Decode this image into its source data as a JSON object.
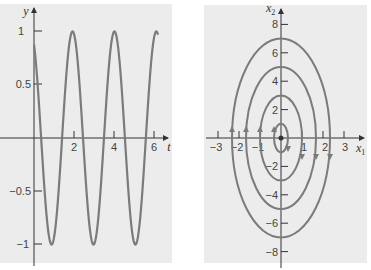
{
  "chart_data": [
    {
      "type": "line",
      "title": "",
      "xlabel": "t",
      "ylabel": "y",
      "xlim": [
        0,
        6.3
      ],
      "ylim": [
        -1.1,
        1.15
      ],
      "x_ticks": [
        2,
        4,
        6
      ],
      "x_tick_labels": [
        "2",
        "4",
        "6"
      ],
      "y_ticks": [
        1,
        0.5,
        -0.5,
        -1
      ],
      "y_tick_labels": [
        "1",
        "0.5",
        "−0.5",
        "−1"
      ],
      "grid": false,
      "series": [
        {
          "name": "y(t)",
          "description": "oscillation y ≈ cos(3t + 0.5), period ≈ 2.09",
          "x": [
            0,
            0.4,
            0.95,
            1.5,
            2.0,
            2.5,
            3.05,
            3.6,
            4.1,
            4.6,
            5.15,
            5.7,
            6.2
          ],
          "y": [
            0.88,
            0.0,
            -1.0,
            0.0,
            1.0,
            0.0,
            -1.0,
            0.0,
            1.0,
            0.0,
            -1.0,
            0.0,
            1.0
          ]
        }
      ],
      "color": "#7a7a7a",
      "background": "#ececec"
    },
    {
      "type": "line",
      "subtype": "phase-portrait",
      "title": "",
      "xlabel": "x1",
      "ylabel": "x2",
      "xlim": [
        -3.5,
        3.5
      ],
      "ylim": [
        -9,
        9
      ],
      "x_ticks": [
        -3,
        -2,
        -1,
        1,
        2,
        3
      ],
      "x_tick_labels": [
        "−3",
        "−2",
        "−1",
        "1",
        "2",
        "3"
      ],
      "y_ticks": [
        8,
        6,
        4,
        2,
        -2,
        -4,
        -6,
        -8
      ],
      "y_tick_labels": [
        "8",
        "6",
        "4",
        "2",
        "−2",
        "−4",
        "−6",
        "−8"
      ],
      "grid": false,
      "series": [
        {
          "name": "trajectory c=1",
          "x1_semi_axis": 0.33,
          "x2_semi_axis": 1,
          "direction": "clockwise"
        },
        {
          "name": "trajectory c=3",
          "x1_semi_axis": 1.0,
          "x2_semi_axis": 3,
          "direction": "clockwise"
        },
        {
          "name": "trajectory c=5",
          "x1_semi_axis": 1.67,
          "x2_semi_axis": 5,
          "direction": "clockwise"
        },
        {
          "name": "trajectory c=7",
          "x1_semi_axis": 2.33,
          "x2_semi_axis": 7,
          "direction": "clockwise"
        }
      ],
      "annotations": [
        "equilibrium point at origin",
        "arrows up on left side, down on right side"
      ],
      "color": "#7a7a7a",
      "background": "#ececec"
    }
  ],
  "left": {
    "xlabel": "t",
    "ylabel": "y",
    "xticks": [
      "2",
      "4",
      "6"
    ],
    "yticks": [
      "1",
      "0.5",
      "−0.5",
      "−1"
    ]
  },
  "right": {
    "xlabel": "x",
    "xlabel_sub": "1",
    "ylabel": "x",
    "ylabel_sub": "2",
    "xticks": [
      "−3",
      "−2",
      "−1",
      "1",
      "2",
      "3"
    ],
    "yticks": [
      "8",
      "6",
      "4",
      "2",
      "−2",
      "−4",
      "−6",
      "−8"
    ]
  }
}
